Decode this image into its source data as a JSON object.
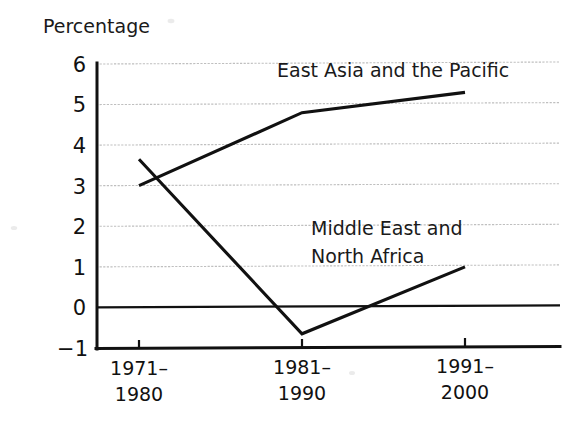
{
  "chart_data": {
    "type": "line",
    "title": "",
    "ylabel": "Percentage",
    "xlabel": "",
    "categories": [
      "1971–1980",
      "1981–1990",
      "1991–2000"
    ],
    "series": [
      {
        "name": "East Asia and the Pacific",
        "values": [
          3.0,
          4.8,
          5.3
        ]
      },
      {
        "name": "Middle East and North Africa",
        "values": [
          3.65,
          -0.65,
          1.0
        ]
      }
    ],
    "ylim": [
      -1,
      6
    ],
    "yticks": [
      "6",
      "5",
      "4",
      "3",
      "2",
      "1",
      "0",
      "-1"
    ],
    "ytick_values": [
      6,
      5,
      4,
      3,
      2,
      1,
      0,
      -1
    ],
    "grid": true,
    "legend": "inline-labels",
    "line_color": "#111111",
    "grid_color": "#bfbfbf"
  },
  "axis": {
    "y_title": "Percentage",
    "ticks_y": {
      "t6": "6",
      "t5": "5",
      "t4": "4",
      "t3": "3",
      "t2": "2",
      "t1": "1",
      "t0": "0",
      "tm1": "−1"
    },
    "ticks_x": [
      {
        "line1": "1971–",
        "line2": "1980"
      },
      {
        "line1": "1981–",
        "line2": "1990"
      },
      {
        "line1": "1991–",
        "line2": "2000"
      }
    ]
  },
  "labels": {
    "east_asia": "East Asia and the Pacific",
    "middle_east_line1": "Middle East and",
    "middle_east_line2": "North Africa"
  }
}
